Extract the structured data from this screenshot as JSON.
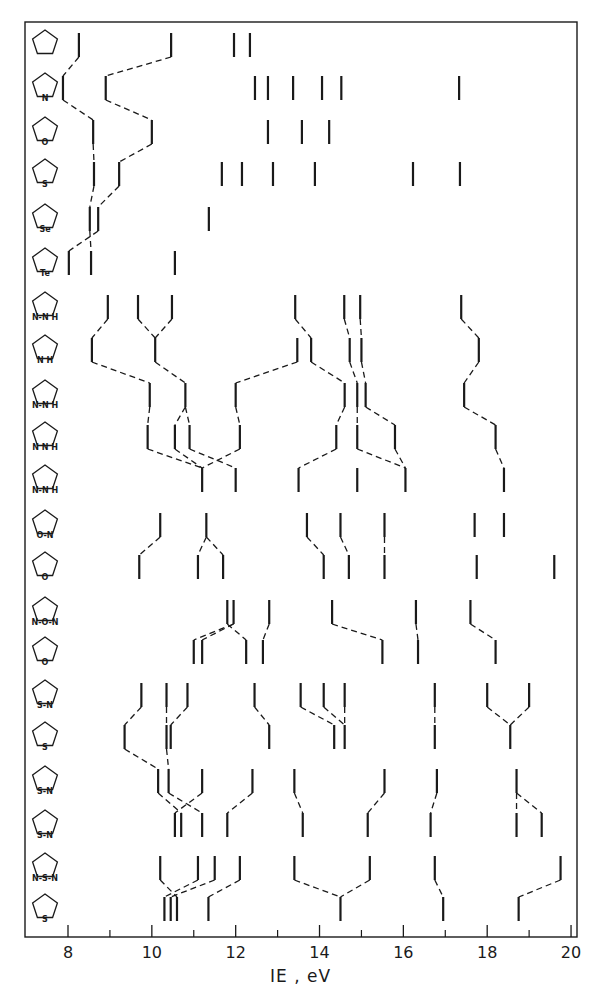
{
  "chart_data": {
    "type": "correlation-diagram",
    "title": "",
    "xlabel": "IE , eV",
    "ylabel": "",
    "xlim": [
      7.4,
      20.2
    ],
    "x_ticks_major": [
      8,
      10,
      12,
      14,
      16,
      18,
      20
    ],
    "x_ticks_minor": [
      9,
      11,
      13,
      15,
      17,
      19
    ],
    "grid": false,
    "rows": [
      {
        "molecule": "cyclopentadiene",
        "ring_heteroatoms": [],
        "ie": [
          8.26,
          10.46,
          11.96,
          12.34
        ]
      },
      {
        "molecule": "pyrrole",
        "ring_heteroatoms": [
          "N"
        ],
        "ie": [
          7.88,
          8.9,
          12.46,
          12.77,
          13.37,
          14.06,
          14.52,
          17.33
        ]
      },
      {
        "molecule": "furan",
        "ring_heteroatoms": [
          "O"
        ],
        "ie": [
          8.6,
          10.0,
          12.77,
          13.58,
          14.23
        ]
      },
      {
        "molecule": "thiophene",
        "ring_heteroatoms": [
          "S"
        ],
        "ie": [
          8.62,
          9.22,
          11.67,
          12.15,
          12.89,
          13.89,
          16.23,
          17.35
        ]
      },
      {
        "molecule": "selenophene",
        "ring_heteroatoms": [
          "Se"
        ],
        "ie": [
          8.52,
          8.72,
          11.36
        ]
      },
      {
        "molecule": "tellurophene",
        "ring_heteroatoms": [
          "Te"
        ],
        "ie": [
          8.02,
          8.55,
          10.55
        ]
      },
      {
        "molecule": "pyrazole",
        "ring_heteroatoms": [
          "N-H",
          "N"
        ],
        "ie": [
          8.95,
          9.67,
          10.48,
          13.42,
          14.59,
          14.97,
          17.38
        ]
      },
      {
        "molecule": "imidazole",
        "ring_heteroatoms": [
          "N-H",
          "N"
        ],
        "ie": [
          8.57,
          10.08,
          13.47,
          13.8,
          14.72,
          15.0,
          17.8
        ]
      },
      {
        "molecule": "1,2,3-triazole",
        "ring_heteroatoms": [
          "N-H",
          "N",
          "N"
        ],
        "ie": [
          9.95,
          10.8,
          12.0,
          14.6,
          14.9,
          15.1,
          17.45
        ]
      },
      {
        "molecule": "1,2,4-triazole",
        "ring_heteroatoms": [
          "N-H",
          "N",
          "N"
        ],
        "ie": [
          9.9,
          10.55,
          10.9,
          12.1,
          14.4,
          14.9,
          15.8,
          18.2
        ]
      },
      {
        "molecule": "tetrazole",
        "ring_heteroatoms": [
          "N-H",
          "N",
          "N",
          "N"
        ],
        "ie": [
          11.2,
          12.0,
          13.5,
          14.9,
          16.05,
          18.4
        ]
      },
      {
        "molecule": "isoxazole",
        "ring_heteroatoms": [
          "O",
          "N"
        ],
        "ie": [
          10.2,
          11.3,
          13.7,
          14.5,
          15.55,
          17.7,
          18.4
        ]
      },
      {
        "molecule": "oxazole",
        "ring_heteroatoms": [
          "O",
          "N"
        ],
        "ie": [
          9.7,
          11.1,
          11.7,
          14.1,
          14.7,
          15.55,
          17.75,
          19.6
        ]
      },
      {
        "molecule": "1,2,5-oxadiazole",
        "ring_heteroatoms": [
          "N",
          "O",
          "N"
        ],
        "ie": [
          11.8,
          11.95,
          12.8,
          14.3,
          16.3,
          17.6
        ]
      },
      {
        "molecule": "1,3,4-oxadiazole",
        "ring_heteroatoms": [
          "N",
          "O",
          "N"
        ],
        "ie": [
          11.0,
          11.2,
          12.25,
          12.65,
          15.5,
          16.35,
          18.2
        ]
      },
      {
        "molecule": "isothiazole",
        "ring_heteroatoms": [
          "S",
          "N"
        ],
        "ie": [
          9.75,
          10.35,
          10.85,
          12.45,
          13.55,
          14.1,
          14.6,
          16.75,
          18.0,
          19.0
        ]
      },
      {
        "molecule": "thiazole",
        "ring_heteroatoms": [
          "S",
          "N"
        ],
        "ie": [
          9.35,
          10.35,
          10.45,
          12.8,
          14.35,
          14.6,
          16.75,
          18.55
        ]
      },
      {
        "molecule": "1,2,3-thiadiazole",
        "ring_heteroatoms": [
          "S",
          "N",
          "N"
        ],
        "ie": [
          10.15,
          10.4,
          11.2,
          12.4,
          13.4,
          15.55,
          16.8,
          18.7
        ]
      },
      {
        "molecule": "1,2,4-thiadiazole",
        "ring_heteroatoms": [
          "S",
          "N",
          "N"
        ],
        "ie": [
          10.55,
          10.7,
          11.2,
          11.8,
          13.6,
          15.15,
          16.65,
          18.7,
          19.3
        ]
      },
      {
        "molecule": "1,2,5-thiadiazole",
        "ring_heteroatoms": [
          "N",
          "S",
          "N"
        ],
        "ie": [
          10.2,
          11.1,
          11.5,
          12.1,
          13.4,
          15.2,
          16.75,
          19.75
        ]
      },
      {
        "molecule": "1,3,4-thiadiazole",
        "ring_heteroatoms": [
          "N",
          "S",
          "N"
        ],
        "ie": [
          10.3,
          10.45,
          10.6,
          11.35,
          14.5,
          16.95,
          18.75
        ]
      }
    ],
    "correlations": [
      [
        0,
        0,
        1,
        0
      ],
      [
        0,
        1,
        1,
        1
      ],
      [
        1,
        0,
        2,
        0
      ],
      [
        1,
        1,
        2,
        1
      ],
      [
        2,
        0,
        3,
        0
      ],
      [
        2,
        1,
        3,
        1
      ],
      [
        3,
        0,
        4,
        0
      ],
      [
        3,
        1,
        4,
        1
      ],
      [
        4,
        0,
        5,
        1
      ],
      [
        4,
        1,
        5,
        0
      ],
      [
        6,
        0,
        7,
        0
      ],
      [
        6,
        1,
        7,
        1
      ],
      [
        6,
        2,
        7,
        1
      ],
      [
        6,
        3,
        7,
        3
      ],
      [
        6,
        4,
        7,
        4
      ],
      [
        6,
        5,
        7,
        5
      ],
      [
        6,
        6,
        7,
        6
      ],
      [
        7,
        0,
        8,
        0
      ],
      [
        7,
        1,
        8,
        1
      ],
      [
        7,
        2,
        8,
        2
      ],
      [
        7,
        3,
        8,
        3
      ],
      [
        7,
        4,
        8,
        4
      ],
      [
        7,
        5,
        8,
        5
      ],
      [
        7,
        6,
        8,
        6
      ],
      [
        8,
        0,
        9,
        0
      ],
      [
        8,
        1,
        9,
        1
      ],
      [
        8,
        1,
        9,
        2
      ],
      [
        8,
        2,
        9,
        3
      ],
      [
        8,
        3,
        9,
        4
      ],
      [
        8,
        4,
        9,
        5
      ],
      [
        8,
        5,
        9,
        6
      ],
      [
        8,
        6,
        9,
        7
      ],
      [
        9,
        0,
        10,
        0
      ],
      [
        9,
        1,
        10,
        0
      ],
      [
        9,
        2,
        10,
        1
      ],
      [
        9,
        3,
        10,
        0
      ],
      [
        9,
        4,
        10,
        2
      ],
      [
        9,
        5,
        10,
        4
      ],
      [
        9,
        6,
        10,
        4
      ],
      [
        9,
        7,
        10,
        5
      ],
      [
        11,
        0,
        12,
        0
      ],
      [
        11,
        1,
        12,
        1
      ],
      [
        11,
        1,
        12,
        2
      ],
      [
        11,
        2,
        12,
        3
      ],
      [
        11,
        3,
        12,
        4
      ],
      [
        11,
        4,
        12,
        5
      ],
      [
        13,
        0,
        14,
        2
      ],
      [
        13,
        1,
        14,
        0
      ],
      [
        13,
        1,
        14,
        1
      ],
      [
        13,
        2,
        14,
        3
      ],
      [
        13,
        3,
        14,
        4
      ],
      [
        13,
        4,
        14,
        5
      ],
      [
        13,
        5,
        14,
        6
      ],
      [
        15,
        0,
        16,
        0
      ],
      [
        15,
        1,
        16,
        1
      ],
      [
        15,
        2,
        16,
        2
      ],
      [
        15,
        3,
        16,
        3
      ],
      [
        15,
        4,
        16,
        4
      ],
      [
        15,
        5,
        16,
        5
      ],
      [
        15,
        6,
        16,
        5
      ],
      [
        15,
        7,
        16,
        6
      ],
      [
        15,
        8,
        16,
        7
      ],
      [
        15,
        9,
        16,
        7
      ],
      [
        16,
        0,
        17,
        0
      ],
      [
        16,
        1,
        17,
        1
      ],
      [
        17,
        0,
        18,
        1
      ],
      [
        17,
        1,
        18,
        2
      ],
      [
        17,
        2,
        18,
        0
      ],
      [
        17,
        3,
        18,
        3
      ],
      [
        17,
        4,
        18,
        4
      ],
      [
        17,
        5,
        18,
        5
      ],
      [
        17,
        6,
        18,
        6
      ],
      [
        17,
        7,
        18,
        7
      ],
      [
        17,
        7,
        18,
        8
      ],
      [
        19,
        0,
        20,
        2
      ],
      [
        19,
        1,
        20,
        0
      ],
      [
        19,
        2,
        20,
        1
      ],
      [
        19,
        3,
        20,
        3
      ],
      [
        19,
        4,
        20,
        4
      ],
      [
        19,
        5,
        20,
        4
      ],
      [
        19,
        6,
        20,
        5
      ],
      [
        19,
        7,
        20,
        6
      ]
    ]
  },
  "axis": {
    "tick_labels": [
      "8",
      "10",
      "12",
      "14",
      "16",
      "18",
      "20"
    ],
    "xlabel": "IE , eV"
  },
  "row_labels": [
    "",
    "N",
    "O",
    "S",
    "Se",
    "Te",
    "N-N H",
    "N H",
    "N-N H",
    "N N H",
    "N-N H",
    "O-N",
    "O",
    "N-O-N",
    "O",
    "S-N",
    "S",
    "S-N",
    "S-N",
    "N-S-N",
    "S"
  ],
  "colors": {
    "ink": "#1a1a1a",
    "background": "#ffffff"
  }
}
